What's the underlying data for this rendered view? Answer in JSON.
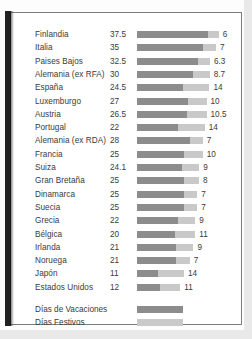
{
  "chart_data": {
    "type": "bar",
    "subtype": "stacked-horizontal",
    "title": "",
    "xlabel": "",
    "ylabel": "",
    "legend_position": "bottom-left",
    "grid": false,
    "categories": [
      "Finlandia",
      "Italia",
      "Paises Bajos",
      "Alemania (ex RFA)",
      "España",
      "Luxemburgo",
      "Austria",
      "Portugal",
      "Alemania (ex RDA)",
      "Francia",
      "Suiza",
      "Gran Bretaña",
      "Dinamarca",
      "Suecia",
      "Grecia",
      "Bélgica",
      "Irlanda",
      "Noruega",
      "Japón",
      "Estados Unidos"
    ],
    "series": [
      {
        "name": "Días de Vacaciones",
        "color": "#8c8c8c",
        "values": [
          37.5,
          35,
          32.5,
          30,
          24.5,
          27,
          26.5,
          22,
          28,
          25,
          24.1,
          25,
          25,
          25,
          22,
          20,
          21,
          21,
          11,
          12
        ]
      },
      {
        "name": "Días Festivos",
        "color": "#c9c9c9",
        "values": [
          6,
          7,
          6.3,
          8.7,
          14,
          10,
          10.5,
          14,
          7,
          10,
          9,
          8,
          7,
          7,
          9,
          11,
          9,
          7,
          14,
          11
        ]
      }
    ],
    "value_labels_left": [
      "37.5",
      "35",
      "32.5",
      "30",
      "24.5",
      "27",
      "26.5",
      "22",
      "28",
      "25",
      "24.1",
      "25",
      "25",
      "25",
      "22",
      "20",
      "21",
      "21",
      "11",
      "12"
    ],
    "value_labels_right": [
      "6",
      "7",
      "6.3",
      "8.7",
      "14",
      "10",
      "10.5",
      "14",
      "7",
      "10",
      "9",
      "8",
      "7",
      "7",
      "9",
      "11",
      "9",
      "7",
      "14",
      "11"
    ]
  },
  "legend": {
    "items": [
      {
        "label": "Días de Vacaciones",
        "swatch": "vacation"
      },
      {
        "label": "Días Festivos",
        "swatch": "holiday"
      }
    ]
  },
  "colors": {
    "vacation": "#8c8c8c",
    "holiday": "#c9c9c9",
    "text": "#3a3a3a",
    "frame": "#7d7d7d",
    "page": "#ffffff"
  }
}
